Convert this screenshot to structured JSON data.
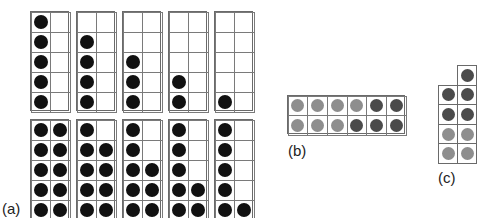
{
  "colors": {
    "black_dot": "#111111",
    "light_dot": "#8e8e8e",
    "dark_dot": "#4b4b4b",
    "grid": "#6a6a6a"
  },
  "panel_a": {
    "label": "(a)",
    "description": "Ten-frames (2 columns x 5 rows) showing counts",
    "top_row": [
      {
        "count": 5,
        "left_col_filled_from_bottom": 5,
        "right_col_filled_from_bottom": 0
      },
      {
        "count": 4,
        "left_col_filled_from_bottom": 4,
        "right_col_filled_from_bottom": 0
      },
      {
        "count": 3,
        "left_col_filled_from_bottom": 3,
        "right_col_filled_from_bottom": 0
      },
      {
        "count": 2,
        "left_col_filled_from_bottom": 2,
        "right_col_filled_from_bottom": 0
      },
      {
        "count": 1,
        "left_col_filled_from_bottom": 1,
        "right_col_filled_from_bottom": 0
      }
    ],
    "bottom_row": [
      {
        "count": 10,
        "left_col_filled_from_bottom": 5,
        "right_col_filled_from_bottom": 5
      },
      {
        "count": 9,
        "left_col_filled_from_bottom": 5,
        "right_col_filled_from_bottom": 4
      },
      {
        "count": 8,
        "left_col_filled_from_bottom": 5,
        "right_col_filled_from_bottom": 3
      },
      {
        "count": 7,
        "left_col_filled_from_bottom": 5,
        "right_col_filled_from_bottom": 2
      },
      {
        "count": 6,
        "left_col_filled_from_bottom": 5,
        "right_col_filled_from_bottom": 1
      }
    ]
  },
  "panel_b": {
    "label": "(b)",
    "description": "2 x 6 frame with light and dark counters",
    "rows": [
      [
        "light",
        "light",
        "light",
        "light",
        "dark",
        "dark"
      ],
      [
        "light",
        "light",
        "light",
        "dark",
        "dark",
        "dark"
      ]
    ]
  },
  "panel_c": {
    "label": "(c)",
    "description": "2-column frame with extra top cell in right column",
    "rows": [
      [
        "none",
        "dark"
      ],
      [
        "dark",
        "dark"
      ],
      [
        "dark",
        "dark"
      ],
      [
        "light",
        "light"
      ],
      [
        "light",
        "light"
      ]
    ]
  }
}
